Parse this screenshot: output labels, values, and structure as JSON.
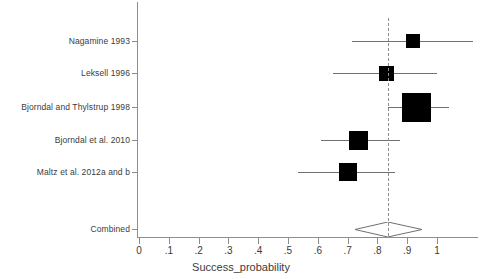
{
  "chart_data": {
    "type": "forest",
    "title": "",
    "xlabel": "Success_probability",
    "ylabel": "",
    "xlim": [
      0,
      1.15
    ],
    "xticks": [
      0,
      0.1,
      0.2,
      0.3,
      0.4,
      0.5,
      0.6,
      0.7,
      0.8,
      0.9,
      1
    ],
    "xtick_labels": [
      "0",
      ".1",
      ".2",
      ".3",
      ".4",
      ".5",
      ".6",
      ".7",
      ".8",
      ".9",
      "1"
    ],
    "grid": false,
    "legend": false,
    "reference_line": 0.835,
    "studies": [
      {
        "label": "Nagamine 1993",
        "estimate": 0.92,
        "ci_low": 0.715,
        "ci_high": 1.12,
        "weight_box_px": 14
      },
      {
        "label": "Leksell 1996",
        "estimate": 0.83,
        "ci_low": 0.65,
        "ci_high": 1.0,
        "weight_box_px": 15
      },
      {
        "label": "Bjorndal and Thylstrup 1998",
        "estimate": 0.93,
        "ci_low": 0.835,
        "ci_high": 1.04,
        "weight_box_px": 29
      },
      {
        "label": "Bjorndal et al. 2010",
        "estimate": 0.735,
        "ci_low": 0.61,
        "ci_high": 0.875,
        "weight_box_px": 19
      },
      {
        "label": "Maltz et al. 2012a and b",
        "estimate": 0.7,
        "ci_low": 0.535,
        "ci_high": 0.86,
        "weight_box_px": 18
      }
    ],
    "combined": {
      "label": "Combined",
      "estimate": 0.835,
      "ci_low": 0.725,
      "ci_high": 0.95
    }
  },
  "colors": {
    "marker": "#000000",
    "ci": "#707070",
    "axis": "#8d8d8d",
    "text": "#3b3b3b",
    "background": "#ffffff"
  }
}
